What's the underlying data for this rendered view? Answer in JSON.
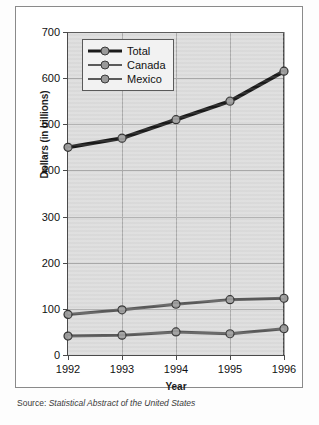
{
  "chart_data": {
    "type": "line",
    "title": "",
    "xlabel": "Year",
    "ylabel": "Dollars (in billions)",
    "categories": [
      "1992",
      "1993",
      "1994",
      "1995",
      "1996"
    ],
    "x": [
      1992,
      1993,
      1994,
      1995,
      1996
    ],
    "xlim": [
      1992,
      1996
    ],
    "ylim": [
      0,
      700
    ],
    "yticks": [
      0,
      100,
      200,
      300,
      400,
      500,
      600,
      700
    ],
    "ytick_labels": [
      "0",
      "100",
      "200",
      "300",
      "400",
      "500",
      "600",
      "700"
    ],
    "grid": true,
    "legend_position": "top-left",
    "series": [
      {
        "name": "Total",
        "values": [
          450,
          470,
          510,
          550,
          615
        ],
        "color": "#1a1a1a",
        "line_width": 4,
        "marker": "circle",
        "marker_color": "#9a9a9a"
      },
      {
        "name": "Canada",
        "values": [
          88,
          98,
          110,
          120,
          123
        ],
        "color": "#5a5a5a",
        "line_width": 3,
        "marker": "circle",
        "marker_color": "#9a9a9a"
      },
      {
        "name": "Mexico",
        "values": [
          41,
          43,
          50,
          46,
          57
        ],
        "color": "#5a5a5a",
        "line_width": 3,
        "marker": "circle",
        "marker_color": "#9a9a9a"
      }
    ],
    "annotations": [],
    "source_prefix": "Source:",
    "source_title": "Statistical Abstract of the United States",
    "plot_background": "#dcdcdc",
    "grid_color": "#aaaaaa",
    "axis_color": "#4a4a4a",
    "figure_border": "#8a8a8a"
  }
}
